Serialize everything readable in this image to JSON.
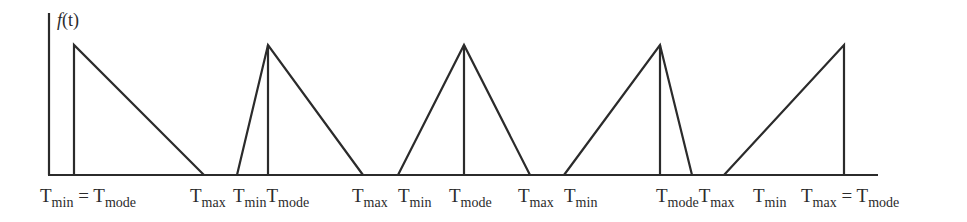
{
  "figure": {
    "y_label_func": "f",
    "y_label_arg": "(t)",
    "stroke_color": "#2b2b2b"
  },
  "chart_data": {
    "type": "line",
    "title": "",
    "ylabel": "f(t)",
    "xlabel": "",
    "grid": false,
    "series": [
      {
        "name": "Tmin = Tmode",
        "points": [
          [
            74,
            0
          ],
          [
            74,
            1
          ],
          [
            204,
            0
          ]
        ]
      },
      {
        "name": "Tmode near Tmin",
        "points": [
          [
            237,
            0
          ],
          [
            268,
            1
          ],
          [
            363,
            0
          ]
        ]
      },
      {
        "name": "Symmetric",
        "points": [
          [
            398,
            0
          ],
          [
            464,
            1
          ],
          [
            530,
            0
          ]
        ]
      },
      {
        "name": "Tmode near Tmax",
        "points": [
          [
            564,
            0
          ],
          [
            660,
            1
          ],
          [
            692,
            0
          ]
        ]
      },
      {
        "name": "Tmax = Tmode",
        "points": [
          [
            724,
            0
          ],
          [
            844,
            1
          ],
          [
            844,
            0
          ]
        ]
      }
    ]
  },
  "labels": [
    {
      "x": 40,
      "base": "T",
      "sub": "min",
      "rest": " = T",
      "sub2": "mode"
    },
    {
      "x": 190,
      "base": "T",
      "sub": "max",
      "rest": "",
      "sub2": ""
    },
    {
      "x": 233,
      "base": "T",
      "sub": "min",
      "rest": "T",
      "sub2": "mode"
    },
    {
      "x": 352,
      "base": "T",
      "sub": "max",
      "rest": "",
      "sub2": ""
    },
    {
      "x": 398,
      "base": "T",
      "sub": "min",
      "rest": "",
      "sub2": ""
    },
    {
      "x": 449,
      "base": "T",
      "sub": "mode",
      "rest": "",
      "sub2": ""
    },
    {
      "x": 518,
      "base": "T",
      "sub": "max",
      "rest": "",
      "sub2": ""
    },
    {
      "x": 564,
      "base": "T",
      "sub": "min",
      "rest": "",
      "sub2": ""
    },
    {
      "x": 656,
      "base": "T",
      "sub": "mode",
      "rest": "T",
      "sub2": "max"
    },
    {
      "x": 753,
      "base": "T",
      "sub": "min",
      "rest": "",
      "sub2": ""
    },
    {
      "x": 801,
      "base": "T",
      "sub": "max",
      "rest": " = T",
      "sub2": "mode"
    }
  ]
}
